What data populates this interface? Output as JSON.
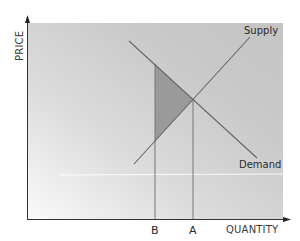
{
  "diagram": {
    "axes": {
      "y_label": "PRICE",
      "x_label": "QUANTITY"
    },
    "curves": {
      "supply_label": "Supply",
      "demand_label": "Demand"
    },
    "markers": {
      "b_label": "B",
      "a_label": "A"
    },
    "colors": {
      "background_light": "#f6f6f6",
      "background_dark": "#c2c2c2",
      "line": "#676767",
      "triangle_fill": "#9a9a9a",
      "axis": "#333333"
    },
    "geometry": {
      "supply": {
        "x1": 134,
        "y1": 164,
        "x2": 250,
        "y2": 37
      },
      "demand": {
        "x1": 129,
        "y1": 41,
        "x2": 257,
        "y2": 158
      },
      "equilibrium": {
        "x": 193,
        "y": 100
      },
      "quantity_b_x": 155,
      "quantity_a_x": 193,
      "shaded_triangle": [
        [
          155,
          64
        ],
        [
          193,
          100
        ],
        [
          155,
          141
        ]
      ]
    }
  }
}
